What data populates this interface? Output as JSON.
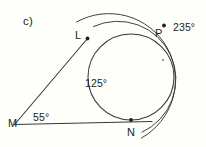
{
  "figure": {
    "part_label": "c)",
    "background_color": "#fefefa",
    "stroke_color": "#3a3637",
    "text_color": "#231f20"
  },
  "points": [
    {
      "id": "L",
      "label": "L",
      "x": 87,
      "y": 38
    },
    {
      "id": "P",
      "label": "P",
      "x": 164,
      "y": 25
    },
    {
      "id": "N",
      "label": "N",
      "x": 131,
      "y": 120
    },
    {
      "id": "M",
      "label": "M",
      "x": 15,
      "y": 124
    },
    {
      "id": "center",
      "label": "",
      "x": 163,
      "y": 60
    }
  ],
  "angles": [
    {
      "id": "arc-LPN",
      "value": "235°",
      "x": 176,
      "y": 28
    },
    {
      "id": "arc-LN",
      "value": "125°",
      "x": 96,
      "y": 84
    },
    {
      "id": "angle-M",
      "value": "55°",
      "x": 41,
      "y": 118
    }
  ],
  "shapes": {
    "circle": {
      "cx": 131,
      "cy": 77,
      "r": 43
    },
    "outer_arc_1": {
      "cx": 131,
      "cy": 77,
      "r": 56
    },
    "outer_arc_2": {
      "cx": 131,
      "cy": 77,
      "r": 62
    },
    "tangent_ML": {
      "x1": 15,
      "y1": 124,
      "x2": 87,
      "y2": 38
    },
    "tangent_MN": {
      "x1": 15,
      "y1": 124,
      "x2": 152,
      "y2": 122
    }
  }
}
